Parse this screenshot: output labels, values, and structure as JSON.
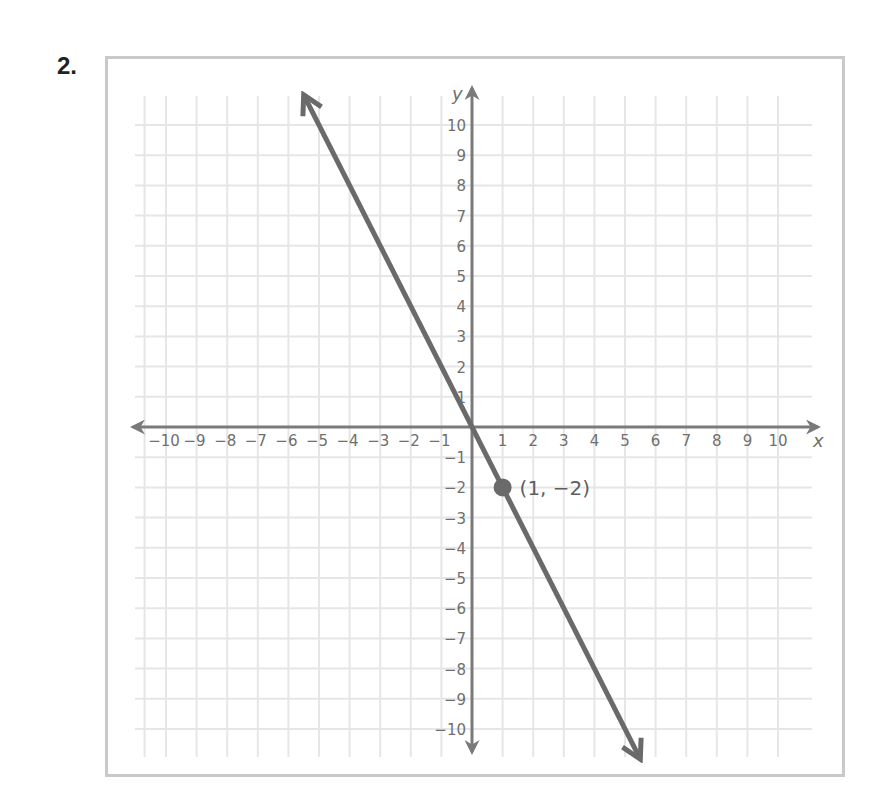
{
  "problem": {
    "number": "2."
  },
  "colors": {
    "line": "#6a6a6a",
    "axis": "#7a7a7a",
    "grid": "#e6e6e6",
    "frame": "#c9c9c9",
    "text": "#6f6f6f"
  },
  "chart_data": {
    "type": "line",
    "title": "",
    "xlabel": "x",
    "ylabel": "y",
    "xlim": [
      -10,
      10
    ],
    "ylim": [
      -10,
      10
    ],
    "grid": true,
    "x_ticks": [
      "-10",
      "-9",
      "-8",
      "-7",
      "-6",
      "-5",
      "-4",
      "-3",
      "-2",
      "-1",
      "1",
      "2",
      "3",
      "4",
      "5",
      "6",
      "7",
      "8",
      "9",
      "10"
    ],
    "y_ticks": [
      "10",
      "9",
      "8",
      "7",
      "6",
      "5",
      "4",
      "3",
      "2",
      "1",
      "-1",
      "-2",
      "-3",
      "-4",
      "-5",
      "-6",
      "-7",
      "-8",
      "-9",
      "-10"
    ],
    "series": [
      {
        "name": "y = -2x",
        "equation": "y = -2x",
        "x": [
          -5.5,
          0,
          1,
          5.5
        ],
        "y": [
          11,
          0,
          -2,
          -11
        ],
        "arrows_both_ends": true
      }
    ],
    "points": [
      {
        "x": 1,
        "y": -2,
        "label": "(1, −2)"
      }
    ],
    "annotations": [
      "(1, −2)"
    ]
  }
}
